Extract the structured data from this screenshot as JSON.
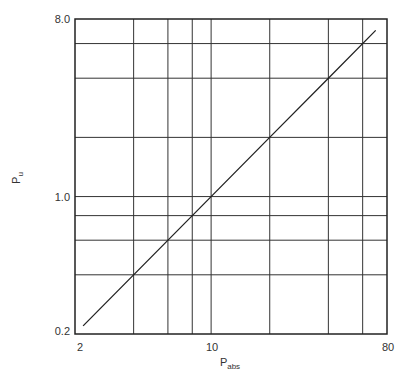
{
  "chart_data": {
    "type": "line",
    "title": "",
    "xlabel": "P",
    "xlabel_sub": "abs",
    "ylabel": "P",
    "ylabel_sub": "u",
    "xscale": "log",
    "yscale": "log",
    "xlim": [
      2,
      80
    ],
    "ylim": [
      0.2,
      8.0
    ],
    "x_tick_labels": [
      "2",
      "10",
      "80"
    ],
    "x_tick_values": [
      2,
      10,
      80
    ],
    "y_tick_labels": [
      "0.2",
      "1.0",
      "8.0"
    ],
    "y_tick_values": [
      0.2,
      1.0,
      8.0
    ],
    "x_gridlines": [
      4,
      6,
      8,
      10,
      20,
      40,
      60
    ],
    "y_gridlines": [
      0.4,
      0.6,
      0.8,
      1.0,
      2,
      4,
      6
    ],
    "grid": true,
    "legend": null,
    "series": [
      {
        "name": "P_u vs P_abs",
        "x": [
          2.2,
          10,
          20,
          40,
          70
        ],
        "y": [
          0.22,
          1.0,
          2.0,
          4.0,
          7.0
        ]
      }
    ]
  },
  "labels": {
    "x_axis_main": "P",
    "x_axis_sub": "abs",
    "y_axis_main": "P",
    "y_axis_sub": "u",
    "x_ticks": [
      "2",
      "10",
      "80"
    ],
    "y_ticks": [
      "0.2",
      "1.0",
      "8.0"
    ]
  }
}
